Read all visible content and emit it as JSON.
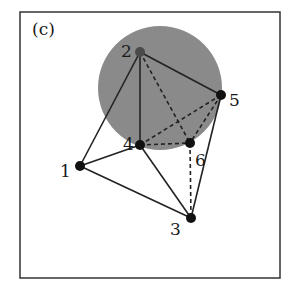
{
  "panel_label": "(c)",
  "colors": {
    "frame": "#333333",
    "disk": "#8a8a8a",
    "edge": "#222222",
    "node": "#111111",
    "node_inside": "#4a4a4a"
  },
  "disk": {
    "cx": 160,
    "cy": 88,
    "r": 62
  },
  "nodes": [
    {
      "id": "1",
      "label": "1",
      "x": 80,
      "y": 166,
      "lx": 60,
      "ly": 177
    },
    {
      "id": "2",
      "label": "2",
      "x": 140,
      "y": 52,
      "lx": 121,
      "ly": 57
    },
    {
      "id": "3",
      "label": "3",
      "x": 191,
      "y": 218,
      "lx": 170,
      "ly": 235
    },
    {
      "id": "4",
      "label": "4",
      "x": 140,
      "y": 145,
      "lx": 123,
      "ly": 150
    },
    {
      "id": "5",
      "label": "5",
      "x": 221,
      "y": 95,
      "lx": 229,
      "ly": 106
    },
    {
      "id": "6",
      "label": "6",
      "x": 190,
      "y": 143,
      "lx": 195,
      "ly": 166
    }
  ],
  "edges": [
    {
      "from": "1",
      "to": "2",
      "style": "solid"
    },
    {
      "from": "1",
      "to": "4",
      "style": "solid"
    },
    {
      "from": "1",
      "to": "3",
      "style": "solid"
    },
    {
      "from": "2",
      "to": "4",
      "style": "solid"
    },
    {
      "from": "2",
      "to": "5",
      "style": "solid"
    },
    {
      "from": "2",
      "to": "6",
      "style": "dashed"
    },
    {
      "from": "4",
      "to": "3",
      "style": "solid"
    },
    {
      "from": "4",
      "to": "5",
      "style": "dashed"
    },
    {
      "from": "4",
      "to": "6",
      "style": "dashed"
    },
    {
      "from": "5",
      "to": "6",
      "style": "dashed"
    },
    {
      "from": "5",
      "to": "3",
      "style": "solid"
    },
    {
      "from": "6",
      "to": "3",
      "style": "dashed"
    }
  ]
}
